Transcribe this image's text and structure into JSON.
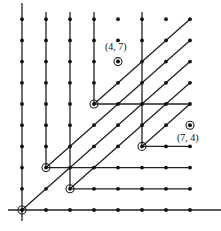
{
  "diagram": {
    "origin_px": [
      22,
      210
    ],
    "step_px": [
      24,
      21.2
    ],
    "colors": {
      "ink": "#222222",
      "background": "#ffffff"
    },
    "axes": {
      "x_axis": {
        "from_px": [
          8,
          210
        ],
        "to_px": [
          221,
          210
        ]
      },
      "y_axis": {
        "from_px": [
          22,
          221
        ],
        "to_px": [
          22,
          3
        ]
      }
    },
    "vertical_rays": [
      {
        "from": [
          1,
          2
        ],
        "top_px": 12
      },
      {
        "from": [
          2,
          1
        ],
        "top_px": 12
      },
      {
        "from": [
          3,
          5
        ],
        "top_px": 12
      },
      {
        "from": [
          5,
          3
        ],
        "top_px": 12
      }
    ],
    "horizontal_segments": [
      {
        "from": [
          1,
          2
        ],
        "to": [
          7,
          2
        ]
      },
      {
        "from": [
          2,
          1
        ],
        "to": [
          7,
          1
        ]
      },
      {
        "from": [
          3,
          5
        ],
        "to": [
          7,
          5
        ]
      },
      {
        "from": [
          5,
          3
        ],
        "to": [
          7,
          3
        ]
      }
    ],
    "diagonal_segments": [
      {
        "from": [
          0,
          0
        ],
        "to": [
          7,
          7
        ]
      },
      {
        "from": [
          1,
          2
        ],
        "to": [
          7,
          8
        ]
      },
      {
        "from": [
          2,
          1
        ],
        "to": [
          7,
          6
        ]
      },
      {
        "from": [
          3,
          5
        ],
        "to": [
          7,
          9
        ]
      },
      {
        "from": [
          5,
          3
        ],
        "to": [
          7,
          5
        ]
      }
    ],
    "ringed_vertices": [
      [
        0,
        0
      ],
      [
        1,
        2
      ],
      [
        2,
        1
      ],
      [
        3,
        5
      ],
      [
        5,
        3
      ]
    ],
    "marked_points": [
      {
        "pt": [
          4,
          7
        ],
        "label": "(4, 7)",
        "label_offset_px": [
          -13,
          -12
        ]
      },
      {
        "pt": [
          7,
          4
        ],
        "label": "(7, 4)",
        "label_offset_px": [
          -13,
          16
        ]
      }
    ],
    "extra_dots": [
      [
        4,
        9
      ],
      [
        4,
        8
      ],
      [
        6,
        9
      ]
    ]
  }
}
